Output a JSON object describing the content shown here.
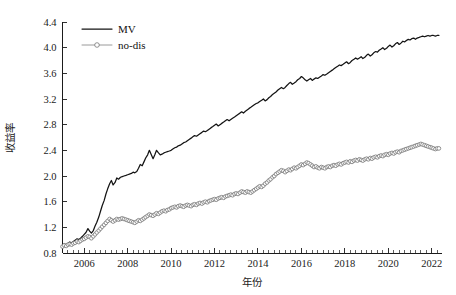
{
  "chart_data": {
    "type": "line",
    "title": "",
    "xlabel": "年份",
    "ylabel": "收益率",
    "xlim": [
      2005.0,
      2022.45
    ],
    "ylim": [
      0.8,
      4.4
    ],
    "xticks": [
      2006,
      2008,
      2010,
      2012,
      2014,
      2016,
      2018,
      2020,
      2022
    ],
    "xtick_labels": [
      "2006",
      "2008",
      "2010",
      "2012",
      "2014",
      "2016",
      "2018",
      "2020",
      "2022"
    ],
    "yticks": [
      0.8,
      1.2,
      1.6,
      2.0,
      2.4,
      2.8,
      3.2,
      3.6,
      4.0,
      4.4
    ],
    "ytick_labels": [
      "0.8",
      "1.2",
      "1.6",
      "2.0",
      "2.4",
      "2.8",
      "3.2",
      "3.6",
      "4.0",
      "4.4"
    ],
    "minor_xtick_interval": 0.25,
    "grid": false,
    "legend_position": "top-left",
    "legend": [
      "MV",
      "no-dis"
    ],
    "colors": {
      "MV": "#141414",
      "no-dis": "#9a9a9a",
      "axis": "#1b1b1b",
      "background": "#ffffff"
    },
    "x": [
      2005.0,
      2005.08,
      2005.17,
      2005.25,
      2005.33,
      2005.42,
      2005.5,
      2005.58,
      2005.67,
      2005.75,
      2005.83,
      2005.92,
      2006.0,
      2006.08,
      2006.17,
      2006.25,
      2006.33,
      2006.42,
      2006.5,
      2006.58,
      2006.67,
      2006.75,
      2006.83,
      2006.92,
      2007.0,
      2007.08,
      2007.17,
      2007.25,
      2007.33,
      2007.42,
      2007.5,
      2007.58,
      2007.67,
      2007.75,
      2007.83,
      2007.92,
      2008.0,
      2008.08,
      2008.17,
      2008.25,
      2008.33,
      2008.42,
      2008.5,
      2008.58,
      2008.67,
      2008.75,
      2008.83,
      2008.92,
      2009.0,
      2009.08,
      2009.17,
      2009.25,
      2009.33,
      2009.42,
      2009.5,
      2009.58,
      2009.67,
      2009.75,
      2009.83,
      2009.92,
      2010.0,
      2010.08,
      2010.17,
      2010.25,
      2010.33,
      2010.42,
      2010.5,
      2010.58,
      2010.67,
      2010.75,
      2010.83,
      2010.92,
      2011.0,
      2011.08,
      2011.17,
      2011.25,
      2011.33,
      2011.42,
      2011.5,
      2011.58,
      2011.67,
      2011.75,
      2011.83,
      2011.92,
      2012.0,
      2012.08,
      2012.17,
      2012.25,
      2012.33,
      2012.42,
      2012.5,
      2012.58,
      2012.67,
      2012.75,
      2012.83,
      2012.92,
      2013.0,
      2013.08,
      2013.17,
      2013.25,
      2013.33,
      2013.42,
      2013.5,
      2013.58,
      2013.67,
      2013.75,
      2013.83,
      2013.92,
      2014.0,
      2014.08,
      2014.17,
      2014.25,
      2014.33,
      2014.42,
      2014.5,
      2014.58,
      2014.67,
      2014.75,
      2014.83,
      2014.92,
      2015.0,
      2015.08,
      2015.17,
      2015.25,
      2015.33,
      2015.42,
      2015.5,
      2015.58,
      2015.67,
      2015.75,
      2015.83,
      2015.92,
      2016.0,
      2016.08,
      2016.17,
      2016.25,
      2016.33,
      2016.42,
      2016.5,
      2016.58,
      2016.67,
      2016.75,
      2016.83,
      2016.92,
      2017.0,
      2017.08,
      2017.17,
      2017.25,
      2017.33,
      2017.42,
      2017.5,
      2017.58,
      2017.67,
      2017.75,
      2017.83,
      2017.92,
      2018.0,
      2018.08,
      2018.17,
      2018.25,
      2018.33,
      2018.42,
      2018.5,
      2018.58,
      2018.67,
      2018.75,
      2018.83,
      2018.92,
      2019.0,
      2019.08,
      2019.17,
      2019.25,
      2019.33,
      2019.42,
      2019.5,
      2019.58,
      2019.67,
      2019.75,
      2019.83,
      2019.92,
      2020.0,
      2020.08,
      2020.17,
      2020.25,
      2020.33,
      2020.42,
      2020.5,
      2020.58,
      2020.67,
      2020.75,
      2020.83,
      2020.92,
      2021.0,
      2021.08,
      2021.17,
      2021.25,
      2021.33,
      2021.42,
      2021.5,
      2021.58,
      2021.67,
      2021.75,
      2021.83,
      2021.92,
      2022.0,
      2022.08,
      2022.17,
      2022.25,
      2022.33
    ],
    "series": [
      {
        "name": "MV",
        "style": "solid-line",
        "values": [
          0.92,
          0.94,
          0.93,
          0.95,
          0.97,
          0.96,
          0.98,
          1.0,
          1.02,
          1.01,
          1.03,
          1.06,
          1.09,
          1.12,
          1.18,
          1.14,
          1.11,
          1.15,
          1.22,
          1.28,
          1.36,
          1.45,
          1.54,
          1.62,
          1.72,
          1.8,
          1.88,
          1.93,
          1.86,
          1.9,
          1.97,
          1.95,
          1.98,
          1.99,
          2.0,
          2.01,
          2.02,
          2.03,
          2.04,
          2.06,
          2.05,
          2.07,
          2.12,
          2.18,
          2.16,
          2.22,
          2.28,
          2.33,
          2.4,
          2.34,
          2.27,
          2.33,
          2.4,
          2.36,
          2.33,
          2.34,
          2.36,
          2.37,
          2.38,
          2.39,
          2.4,
          2.42,
          2.44,
          2.45,
          2.47,
          2.48,
          2.5,
          2.52,
          2.53,
          2.55,
          2.57,
          2.59,
          2.61,
          2.63,
          2.62,
          2.64,
          2.66,
          2.68,
          2.7,
          2.69,
          2.71,
          2.73,
          2.75,
          2.77,
          2.79,
          2.81,
          2.78,
          2.8,
          2.82,
          2.84,
          2.86,
          2.88,
          2.86,
          2.88,
          2.9,
          2.92,
          2.94,
          2.96,
          2.98,
          3.0,
          2.98,
          3.01,
          3.03,
          3.05,
          3.07,
          3.09,
          3.11,
          3.13,
          3.14,
          3.16,
          3.18,
          3.2,
          3.17,
          3.19,
          3.22,
          3.24,
          3.27,
          3.29,
          3.31,
          3.34,
          3.36,
          3.38,
          3.36,
          3.38,
          3.41,
          3.44,
          3.46,
          3.43,
          3.45,
          3.47,
          3.5,
          3.52,
          3.55,
          3.53,
          3.5,
          3.48,
          3.5,
          3.52,
          3.49,
          3.51,
          3.53,
          3.52,
          3.54,
          3.56,
          3.58,
          3.57,
          3.59,
          3.61,
          3.63,
          3.65,
          3.67,
          3.69,
          3.71,
          3.73,
          3.72,
          3.74,
          3.76,
          3.78,
          3.75,
          3.77,
          3.8,
          3.82,
          3.84,
          3.82,
          3.84,
          3.86,
          3.83,
          3.85,
          3.88,
          3.9,
          3.87,
          3.89,
          3.92,
          3.94,
          3.93,
          3.96,
          3.98,
          4.0,
          3.97,
          3.99,
          4.02,
          4.04,
          4.01,
          4.03,
          4.06,
          4.08,
          4.05,
          4.07,
          4.1,
          4.09,
          4.11,
          4.13,
          4.12,
          4.14,
          4.15,
          4.13,
          4.15,
          4.16,
          4.17,
          4.18,
          4.17,
          4.18,
          4.19,
          4.18,
          4.19,
          4.19,
          4.18,
          4.19,
          4.19
        ]
      },
      {
        "name": "no-dis",
        "style": "line-with-open-circle-markers",
        "values": [
          0.9,
          0.92,
          0.91,
          0.93,
          0.94,
          0.93,
          0.95,
          0.96,
          0.98,
          0.97,
          0.99,
          1.01,
          1.02,
          1.04,
          1.06,
          1.05,
          1.03,
          1.06,
          1.09,
          1.12,
          1.15,
          1.18,
          1.21,
          1.24,
          1.27,
          1.3,
          1.33,
          1.31,
          1.29,
          1.31,
          1.33,
          1.32,
          1.33,
          1.34,
          1.33,
          1.32,
          1.31,
          1.3,
          1.29,
          1.28,
          1.27,
          1.29,
          1.31,
          1.3,
          1.32,
          1.34,
          1.36,
          1.38,
          1.4,
          1.39,
          1.38,
          1.4,
          1.42,
          1.41,
          1.43,
          1.45,
          1.46,
          1.45,
          1.47,
          1.48,
          1.5,
          1.51,
          1.52,
          1.51,
          1.53,
          1.54,
          1.53,
          1.52,
          1.54,
          1.55,
          1.54,
          1.53,
          1.55,
          1.56,
          1.55,
          1.57,
          1.58,
          1.57,
          1.59,
          1.6,
          1.59,
          1.61,
          1.62,
          1.63,
          1.64,
          1.63,
          1.65,
          1.66,
          1.67,
          1.66,
          1.68,
          1.69,
          1.7,
          1.71,
          1.7,
          1.72,
          1.73,
          1.72,
          1.74,
          1.76,
          1.75,
          1.74,
          1.76,
          1.75,
          1.74,
          1.76,
          1.78,
          1.8,
          1.82,
          1.84,
          1.83,
          1.85,
          1.88,
          1.9,
          1.93,
          1.95,
          1.98,
          2.0,
          2.03,
          2.05,
          2.07,
          2.09,
          2.08,
          2.06,
          2.08,
          2.1,
          2.09,
          2.11,
          2.13,
          2.12,
          2.14,
          2.16,
          2.18,
          2.17,
          2.19,
          2.21,
          2.2,
          2.18,
          2.16,
          2.14,
          2.15,
          2.13,
          2.12,
          2.14,
          2.13,
          2.12,
          2.14,
          2.15,
          2.14,
          2.16,
          2.17,
          2.16,
          2.18,
          2.19,
          2.18,
          2.2,
          2.21,
          2.22,
          2.21,
          2.23,
          2.22,
          2.24,
          2.25,
          2.24,
          2.26,
          2.25,
          2.24,
          2.26,
          2.27,
          2.26,
          2.28,
          2.27,
          2.29,
          2.3,
          2.29,
          2.31,
          2.32,
          2.31,
          2.33,
          2.34,
          2.33,
          2.35,
          2.36,
          2.35,
          2.37,
          2.38,
          2.37,
          2.39,
          2.4,
          2.41,
          2.42,
          2.43,
          2.44,
          2.45,
          2.46,
          2.47,
          2.48,
          2.49,
          2.5,
          2.49,
          2.48,
          2.47,
          2.46,
          2.45,
          2.44,
          2.43,
          2.42,
          2.43,
          2.43
        ]
      }
    ]
  },
  "legend": {
    "items": [
      {
        "label": "MV",
        "marker": "solid-line-swatch"
      },
      {
        "label": "no-dis",
        "marker": "circle-marker-line-swatch"
      }
    ]
  },
  "axes": {
    "y_title": "收益率",
    "x_title": "年份"
  }
}
